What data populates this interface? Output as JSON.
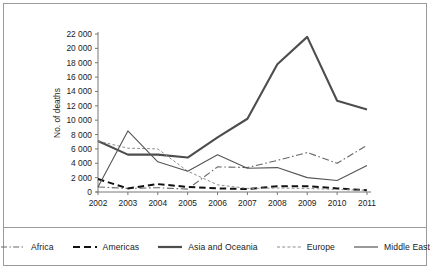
{
  "chart_data": {
    "type": "line",
    "title": "",
    "xlabel": "",
    "ylabel": "No. of deaths",
    "categories": [
      "2002",
      "2003",
      "2004",
      "2005",
      "2006",
      "2007",
      "2008",
      "2009",
      "2010",
      "2011"
    ],
    "x": [
      2002,
      2003,
      2004,
      2005,
      2006,
      2007,
      2008,
      2009,
      2010,
      2011
    ],
    "ylim": [
      0,
      22000
    ],
    "ytick_values": [
      0,
      2000,
      4000,
      6000,
      8000,
      10000,
      12000,
      14000,
      16000,
      18000,
      20000,
      22000
    ],
    "ytick_labels": [
      "0",
      "2 000",
      "4 000",
      "6 000",
      "8 000",
      "10 000",
      "12 000",
      "14 000",
      "16 000",
      "18 000",
      "20 000",
      "22 000"
    ],
    "grid": false,
    "legend_position": "bottom",
    "series": [
      {
        "name": "Africa",
        "style": "dash-dot",
        "color": "#666666",
        "width": 1.1,
        "values": [
          700,
          500,
          600,
          400,
          3500,
          3400,
          4400,
          5500,
          4000,
          6500
        ]
      },
      {
        "name": "Americas",
        "style": "dashed-thick",
        "color": "#111111",
        "width": 2.0,
        "values": [
          1800,
          500,
          1100,
          700,
          500,
          400,
          800,
          800,
          500,
          250
        ]
      },
      {
        "name": "Asia and Oceania",
        "style": "solid-thick",
        "color": "#4d4d4d",
        "width": 2.1,
        "values": [
          7100,
          5200,
          5200,
          4800,
          7600,
          10200,
          17800,
          21600,
          12700,
          11500
        ]
      },
      {
        "name": "Europe",
        "style": "dotted",
        "color": "#8c8c8c",
        "width": 1.0,
        "values": [
          7100,
          6100,
          6000,
          2900,
          1000,
          500,
          550,
          500,
          350,
          250
        ]
      },
      {
        "name": "Middle East",
        "style": "solid-thin",
        "color": "#555555",
        "width": 1.1,
        "values": [
          700,
          8500,
          4200,
          2900,
          5200,
          3300,
          3400,
          2000,
          1600,
          3700
        ]
      }
    ]
  },
  "legend": {
    "items": [
      {
        "label": "Africa"
      },
      {
        "label": "Americas"
      },
      {
        "label": "Asia and Oceania"
      },
      {
        "label": "Europe"
      },
      {
        "label": "Middle East"
      }
    ]
  }
}
